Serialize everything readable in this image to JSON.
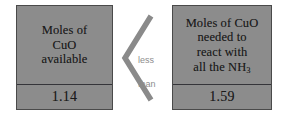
{
  "diagram": {
    "background_color": "#ffffff",
    "box_fill_color": "#8c8c8c",
    "box_border_color": "#4a4a4a",
    "caption_color": "#8d8d8d",
    "chevron_color": "#8a8a8a"
  },
  "left_box": {
    "label_line_1": "Moles of",
    "label_line_2": "CuO",
    "label_line_3": "available",
    "value": "1.14"
  },
  "right_box": {
    "label_line_1": "Moles of CuO",
    "label_line_2": "needed to",
    "label_line_3": "react with",
    "label_line_4_pre": "all the NH",
    "label_line_4_sub": "3",
    "value": "1.59"
  },
  "relation": {
    "symbol": "less-than-chevron",
    "caption_line_1": "less",
    "caption_line_2": "than"
  }
}
